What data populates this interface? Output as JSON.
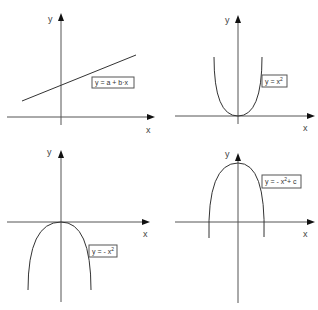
{
  "figure": {
    "panels": [
      {
        "id": "linear",
        "x_label": "x",
        "y_label": "y",
        "equation": "y = a + b·x",
        "equation_parts": {
          "base": "y = a + b·x",
          "sup": "",
          "tail": ""
        },
        "curve_type": "line"
      },
      {
        "id": "parabola-up",
        "x_label": "x",
        "y_label": "y",
        "equation": "y = x^2",
        "equation_parts": {
          "base": "y = x",
          "sup": "2",
          "tail": ""
        },
        "curve_type": "parabola-upward"
      },
      {
        "id": "parabola-down",
        "x_label": "x",
        "y_label": "y",
        "equation": "y = - x^2",
        "equation_parts": {
          "base": "y = - x",
          "sup": "2",
          "tail": ""
        },
        "curve_type": "parabola-downward"
      },
      {
        "id": "parabola-down-shifted",
        "x_label": "x",
        "y_label": "y",
        "equation": "y = - x^2 + c",
        "equation_parts": {
          "base": "y = - x",
          "sup": "2",
          "tail": "+ c"
        },
        "curve_type": "parabola-downward-shifted"
      }
    ],
    "colors": {
      "axis": "#555555",
      "curve": "#333333",
      "arrow": "#111111",
      "background": "#ffffff"
    }
  }
}
